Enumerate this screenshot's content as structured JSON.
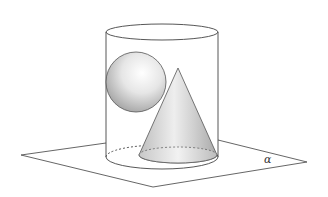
{
  "diagram": {
    "type": "geometry-3d",
    "plane": {
      "label": "α"
    },
    "shapes": [
      "cylinder",
      "sphere",
      "cone"
    ],
    "colors": {
      "stroke": "#444444",
      "plane_stroke": "#555555",
      "fill_light": "#ffffff",
      "fill_shade": "#b8b8b8"
    }
  }
}
